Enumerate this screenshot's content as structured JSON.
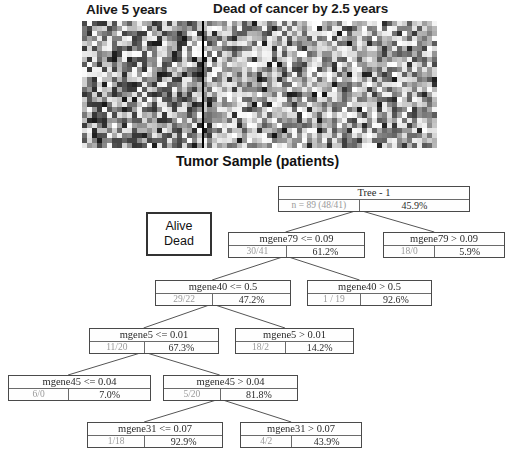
{
  "heatmap": {
    "group_left_label": "Alive 5 years",
    "group_right_label": "Dead of cancer by 2.5 years",
    "axis_label": "Tumor Sample (patients)",
    "colormap": "grayscale",
    "grid_cols": 71,
    "grid_rows": 25,
    "divider_after_col": 24
  },
  "legend": {
    "line1": "Alive",
    "line2": "Dead"
  },
  "tree": {
    "title": "Tree - 1",
    "nodes": [
      {
        "id": "root",
        "head": "Tree - 1",
        "count": "n = 89 (48/41)",
        "pct": "45.9%",
        "x": 278,
        "y": 186,
        "w": 192
      },
      {
        "id": "mgene79_le",
        "head": "mgene79 <= 0.09",
        "count": "30/41",
        "pct": "61.2%",
        "x": 228,
        "y": 232,
        "w": 137
      },
      {
        "id": "mgene79_gt",
        "head": "mgene79 > 0.09",
        "count": "18/0",
        "pct": "5.9%",
        "x": 383,
        "y": 232,
        "w": 122
      },
      {
        "id": "mgene40_le",
        "head": "mgene40 <= 0.5",
        "count": "29/22",
        "pct": "47.2%",
        "x": 155,
        "y": 280,
        "w": 136
      },
      {
        "id": "mgene40_gt",
        "head": "mgene40 > 0.5",
        "count": "1 / 19",
        "pct": "92.6%",
        "x": 307,
        "y": 280,
        "w": 125
      },
      {
        "id": "mgene5_le",
        "head": "mgene5 <= 0.01",
        "count": "11/20",
        "pct": "67.3%",
        "x": 89,
        "y": 328,
        "w": 130
      },
      {
        "id": "mgene5_gt",
        "head": "mgene5 > 0.01",
        "count": "18/2",
        "pct": "14.2%",
        "x": 235,
        "y": 328,
        "w": 119
      },
      {
        "id": "mgene45_le",
        "head": "mgene45 <= 0.04",
        "count": "6/0",
        "pct": "7.0%",
        "x": 8,
        "y": 375,
        "w": 143
      },
      {
        "id": "mgene45_gt",
        "head": "mgene45 > 0.04",
        "count": "5/20",
        "pct": "81.8%",
        "x": 163,
        "y": 375,
        "w": 135
      },
      {
        "id": "mgene31_le",
        "head": "mgene31 <= 0.07",
        "count": "1/18",
        "pct": "92.9%",
        "x": 87,
        "y": 422,
        "w": 136
      },
      {
        "id": "mgene31_gt",
        "head": "mgene31 > 0.07",
        "count": "4/2",
        "pct": "43.9%",
        "x": 240,
        "y": 422,
        "w": 122
      }
    ]
  },
  "colors": {
    "node_border": "#4a4a4a",
    "line": "#555555",
    "count_text": "#9a9a9a",
    "head_text": "#2a2a2a",
    "legend_border": "#333333"
  }
}
